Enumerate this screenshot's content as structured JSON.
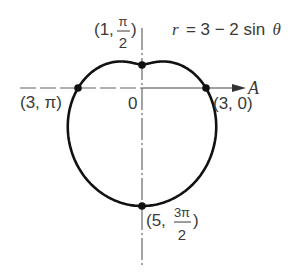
{
  "figure": {
    "equation": {
      "lhs": "r",
      "rhs": "= 3 − 2 sin",
      "theta": "θ"
    },
    "polar_axis_label": "A",
    "origin_label": "0",
    "points": [
      {
        "id": "top",
        "text_open": "(1,",
        "num": "π",
        "den": "2",
        "text_close": ")"
      },
      {
        "id": "left",
        "text": "(3, π)"
      },
      {
        "id": "right",
        "text": "(3, 0)"
      },
      {
        "id": "bottom",
        "text_open": "(5,",
        "num": "3π",
        "den": "2",
        "text_close": ")"
      }
    ],
    "colors": {
      "curve": "#111111",
      "axis": "#555555",
      "text": "#3a3a3a"
    }
  },
  "chart_data": {
    "type": "line",
    "title": "r = 3 − 2 sin θ",
    "coordinate_system": "polar",
    "equation": "r = 3 - 2 sin(theta)",
    "labeled_points": [
      {
        "r": 3,
        "theta": "0",
        "label": "(3, 0)"
      },
      {
        "r": 1,
        "theta": "π/2",
        "label": "(1, π/2)"
      },
      {
        "r": 3,
        "theta": "π",
        "label": "(3, π)"
      },
      {
        "r": 5,
        "theta": "3π/2",
        "label": "(5, 3π/2)"
      }
    ],
    "polar_axis": "A",
    "origin": "0",
    "grid": false
  }
}
